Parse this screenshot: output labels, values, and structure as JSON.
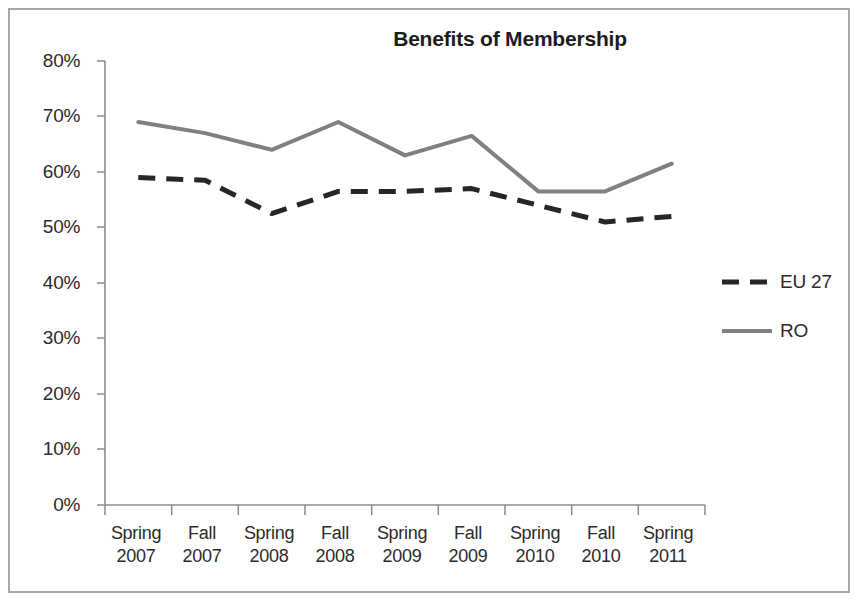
{
  "chart_data": {
    "type": "line",
    "title": "Benefits of Membership",
    "xlabel": "",
    "ylabel": "",
    "ylim": [
      0,
      80
    ],
    "ytick_labels": [
      "80%",
      "70%",
      "60%",
      "50%",
      "40%",
      "30%",
      "20%",
      "10%",
      "0%"
    ],
    "ytick_values": [
      80,
      70,
      60,
      50,
      40,
      30,
      20,
      10,
      0
    ],
    "grid": false,
    "legend_position": "right-center",
    "categories": [
      "Spring 2007",
      "Fall 2007",
      "Spring 2008",
      "Fall 2008",
      "Spring 2009",
      "Fall 2009",
      "Spring 2010",
      "Fall 2010",
      "Spring 2011"
    ],
    "category_lines": [
      {
        "season": "Spring",
        "year": "2007"
      },
      {
        "season": "Fall",
        "year": "2007"
      },
      {
        "season": "Spring",
        "year": "2008"
      },
      {
        "season": "Fall",
        "year": "2008"
      },
      {
        "season": "Spring",
        "year": "2009"
      },
      {
        "season": "Fall",
        "year": "2009"
      },
      {
        "season": "Spring",
        "year": "2010"
      },
      {
        "season": "Fall",
        "year": "2010"
      },
      {
        "season": "Spring",
        "year": "2011"
      }
    ],
    "series": [
      {
        "name": "EU 27",
        "style": "dashed",
        "color": "#262626",
        "values": [
          59,
          58.5,
          52.5,
          56.5,
          56.5,
          57,
          54,
          51,
          52
        ]
      },
      {
        "name": "RO",
        "style": "solid",
        "color": "#808080",
        "values": [
          69,
          67,
          64,
          69,
          63,
          66.5,
          56.5,
          56.5,
          61.5
        ]
      }
    ]
  },
  "axes": {
    "axis_color": "#8d8d8d"
  },
  "legend": {
    "entries": [
      {
        "label": "EU 27"
      },
      {
        "label": "RO"
      }
    ]
  }
}
